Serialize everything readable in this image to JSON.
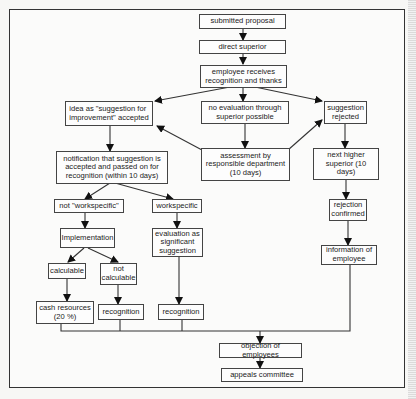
{
  "diagram": {
    "type": "flowchart",
    "nodes": {
      "submitted_proposal": "submitted proposal",
      "direct_superior": "direct superior",
      "recognition_thanks": "employee receives\nrecognition and thanks",
      "idea_accepted": "idea as \"suggestion for\nimprovement\" accepted",
      "no_evaluation": "no evaluation through\nsuperior possible",
      "suggestion_rejected": "suggestion\nrejected",
      "notification": "notification that suggestion is\naccepted and passed on for\nrecognition (within 10 days)",
      "assessment": "assessment by\nresponsible department\n(10 days)",
      "next_higher_superior": "next higher\nsuperior (10 days)",
      "not_workspecific": "not \"workspecific\"",
      "workspecific": "workspecific",
      "rejection_confirmed": "rejection\nconfirmed",
      "implementation": "Implementation",
      "evaluation_significant": "evaluation as\nsignificant\nsuggestion",
      "information_employee": "information of\nemployee",
      "calculable": "calculable",
      "not_calculable": "not\ncalculable",
      "cash_resources": "cash resources\n(20 %)",
      "recognition_1": "recognition",
      "recognition_2": "recognition",
      "objection": "objection of employees",
      "appeals_committee": "appeals committee"
    },
    "edges": [
      [
        "submitted_proposal",
        "direct_superior"
      ],
      [
        "direct_superior",
        "recognition_thanks"
      ],
      [
        "recognition_thanks",
        "idea_accepted"
      ],
      [
        "recognition_thanks",
        "no_evaluation"
      ],
      [
        "recognition_thanks",
        "suggestion_rejected"
      ],
      [
        "no_evaluation",
        "assessment"
      ],
      [
        "assessment",
        "idea_accepted"
      ],
      [
        "assessment",
        "suggestion_rejected"
      ],
      [
        "idea_accepted",
        "notification"
      ],
      [
        "suggestion_rejected",
        "next_higher_superior"
      ],
      [
        "notification",
        "not_workspecific"
      ],
      [
        "notification",
        "workspecific"
      ],
      [
        "next_higher_superior",
        "rejection_confirmed"
      ],
      [
        "not_workspecific",
        "implementation"
      ],
      [
        "workspecific",
        "evaluation_significant"
      ],
      [
        "rejection_confirmed",
        "information_employee"
      ],
      [
        "implementation",
        "calculable"
      ],
      [
        "implementation",
        "not_calculable"
      ],
      [
        "calculable",
        "cash_resources"
      ],
      [
        "not_calculable",
        "recognition_1"
      ],
      [
        "evaluation_significant",
        "recognition_2"
      ],
      [
        "cash_resources",
        "objection"
      ],
      [
        "recognition_1",
        "objection"
      ],
      [
        "recognition_2",
        "objection"
      ],
      [
        "information_employee",
        "objection"
      ],
      [
        "objection",
        "appeals_committee"
      ]
    ]
  }
}
